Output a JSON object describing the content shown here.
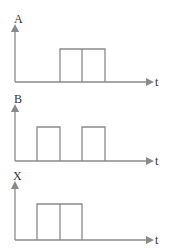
{
  "diagram": {
    "type": "timing-diagram",
    "line_color": "#8a8a8a",
    "text_color": "#333333",
    "panels": [
      {
        "signal_label": "A",
        "time_label": "t",
        "pulses": [
          {
            "start": 60,
            "end": 82
          },
          {
            "start": 82,
            "end": 105
          }
        ],
        "description": "Single high pulse from x≈60 to x≈105 with internal divider at x≈82"
      },
      {
        "signal_label": "B",
        "time_label": "t",
        "pulses": [
          {
            "start": 37,
            "end": 60
          },
          {
            "start": 82,
            "end": 105
          }
        ],
        "description": "Two separate high pulses"
      },
      {
        "signal_label": "X",
        "time_label": "t",
        "pulses": [
          {
            "start": 37,
            "end": 60
          },
          {
            "start": 60,
            "end": 82
          }
        ],
        "description": "Single high pulse from x≈37 to x≈82 with internal divider at x≈60"
      }
    ]
  }
}
